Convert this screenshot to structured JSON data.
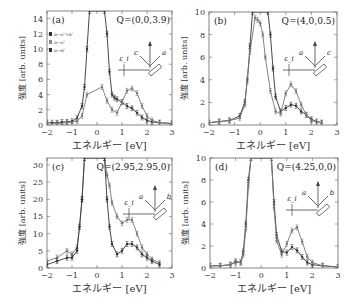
{
  "chart_data": [
    {
      "type": "line",
      "panel_label": "(a)",
      "title": "Q=(0,0,3.9)",
      "xlabel": "エネルギー [eV]",
      "ylabel": "強度 [arb. units]",
      "xlim": [
        -2,
        3
      ],
      "ylim": [
        0,
        15
      ],
      "xticks": [
        -2,
        -1,
        0,
        1,
        2,
        3
      ],
      "yticks": [
        0,
        2,
        4,
        6,
        8,
        10,
        12,
        14
      ],
      "legend": [
        "π→σ'+π'",
        "π→σ'",
        "π→π'"
      ],
      "legend_position": "top-left",
      "inset_labels": [
        "c",
        "a",
        "ε_i"
      ],
      "series": [
        {
          "name": "π→σ'+π'",
          "color": "#333333",
          "x": [
            -2,
            -1.8,
            -1.6,
            -1.4,
            -1.2,
            -1.0,
            -0.8,
            -0.6,
            -0.5,
            -0.4,
            -0.3,
            0.3,
            0.4,
            0.5,
            0.6,
            0.7,
            0.8,
            1.0,
            1.2,
            1.4,
            1.6,
            1.8,
            2.0,
            2.2,
            2.5,
            3.0
          ],
          "y": [
            0.3,
            0.3,
            0.3,
            0.4,
            0.4,
            0.5,
            0.9,
            2.5,
            5,
            10,
            15,
            15,
            12,
            7,
            4,
            3.6,
            3.4,
            3.0,
            2.5,
            2.2,
            1.6,
            1.0,
            0.6,
            0.4,
            0.3,
            0.2
          ]
        },
        {
          "name": "π→σ'",
          "color": "#777777",
          "x": [
            -2,
            -1.6,
            -1.2,
            -0.8,
            -0.6,
            -0.4,
            0.2,
            0.4,
            0.6,
            0.8,
            1.0,
            1.2,
            1.4,
            1.6,
            1.8,
            2.0,
            2.2,
            2.5,
            3.0
          ],
          "y": [
            0.3,
            0.2,
            0.3,
            0.5,
            1.2,
            4.0,
            5.0,
            3.2,
            2.0,
            1.6,
            3.0,
            4.5,
            4.8,
            4.2,
            2.5,
            1.2,
            0.6,
            0.3,
            0.2
          ]
        }
      ]
    },
    {
      "type": "line",
      "panel_label": "(b)",
      "title": "Q=(4,0,0.5)",
      "xlabel": "エネルギー [eV]",
      "ylabel": "強度 [arb. units]",
      "xlim": [
        -2,
        3
      ],
      "ylim": [
        0,
        10
      ],
      "xticks": [
        -2,
        -1,
        0,
        1,
        2,
        3
      ],
      "yticks": [
        0,
        2,
        4,
        6,
        8,
        10
      ],
      "inset_labels": [
        "a",
        "c",
        "ε_i"
      ],
      "series": [
        {
          "name": "π→σ'+π'",
          "color": "#333333",
          "x": [
            -2,
            -1.6,
            -1.2,
            -0.8,
            -0.6,
            -0.5,
            -0.4,
            -0.3,
            0.3,
            0.4,
            0.5,
            0.6,
            0.8,
            1.0,
            1.2,
            1.4,
            1.6,
            1.8,
            2.0,
            2.2,
            2.4
          ],
          "y": [
            0.2,
            0.3,
            0.4,
            0.8,
            2.0,
            4.0,
            7.0,
            10,
            10,
            8.0,
            5.0,
            2.5,
            1.2,
            1.5,
            1.8,
            1.7,
            1.2,
            0.9,
            0.5,
            0.3,
            0.2
          ]
        },
        {
          "name": "π→σ'",
          "color": "#777777",
          "x": [
            -2,
            -1.6,
            -1.2,
            -0.8,
            -0.6,
            -0.4,
            -0.2,
            -0.1,
            0.0,
            0.1,
            0.2,
            0.4,
            0.6,
            0.8,
            1.0,
            1.2,
            1.4,
            1.6,
            1.8,
            2.0,
            2.4
          ],
          "y": [
            0.2,
            0.3,
            0.4,
            0.6,
            1.8,
            6.5,
            9.5,
            9.3,
            9.0,
            8.0,
            6.0,
            3.0,
            1.2,
            1.0,
            2.8,
            3.6,
            3.0,
            1.8,
            0.9,
            0.4,
            0.2
          ]
        }
      ]
    },
    {
      "type": "line",
      "panel_label": "(c)",
      "title": "Q=(2.95,2.95,0)",
      "xlabel": "エネルギー [eV]",
      "ylabel": "強度 [arb. units]",
      "xlim": [
        -2,
        3
      ],
      "ylim": [
        0,
        32
      ],
      "xticks": [
        -2,
        -1,
        0,
        1,
        2,
        3
      ],
      "yticks": [
        0,
        5,
        10,
        15,
        20,
        25,
        30
      ],
      "inset_labels": [
        "a",
        "b",
        "ε_i"
      ],
      "series": [
        {
          "name": "π→σ'+π'",
          "color": "#777777",
          "x": [
            -2,
            -1.6,
            -1.2,
            -1.0,
            -0.8,
            -0.7,
            -0.6,
            -0.5,
            0.3,
            0.4,
            0.5,
            0.6,
            0.8,
            1.0,
            1.2,
            1.4,
            1.6,
            1.8,
            2.0,
            2.2,
            2.5
          ],
          "y": [
            2,
            3,
            5,
            4,
            6,
            12,
            20,
            32,
            32,
            27,
            24,
            19,
            15,
            13,
            14,
            14,
            10,
            6,
            4,
            2.5,
            1.5
          ]
        },
        {
          "name": "π→π'",
          "color": "#333333",
          "x": [
            -2,
            -1.6,
            -1.2,
            -1.0,
            -0.8,
            -0.7,
            -0.6,
            -0.5,
            0.3,
            0.4,
            0.5,
            0.6,
            0.8,
            1.0,
            1.2,
            1.4,
            1.6,
            1.8,
            2.0,
            2.2,
            2.5
          ],
          "y": [
            1,
            2,
            3,
            3,
            5,
            12,
            20,
            32,
            32,
            20,
            12,
            7,
            4,
            5,
            7,
            7,
            6,
            4,
            3,
            2,
            1
          ]
        }
      ]
    },
    {
      "type": "line",
      "panel_label": "(d)",
      "title": "Q=(4.25,0,0)",
      "xlabel": "エネルギー [eV]",
      "ylabel": "強度 [arb. units]",
      "xlim": [
        -2,
        3
      ],
      "ylim": [
        0,
        10
      ],
      "xticks": [
        -2,
        -1,
        0,
        1,
        2,
        3
      ],
      "yticks": [
        0,
        2,
        4,
        6,
        8,
        10
      ],
      "inset_labels": [
        "a",
        "b",
        "ε_i"
      ],
      "series": [
        {
          "name": "π→σ'+π'",
          "color": "#333333",
          "x": [
            -2,
            -1.6,
            -1.2,
            -1.0,
            -0.8,
            -0.7,
            -0.6,
            -0.5,
            -0.4,
            0.4,
            0.5,
            0.6,
            0.8,
            1.0,
            1.2,
            1.4,
            1.6,
            1.8,
            2.0,
            2.4,
            3.0
          ],
          "y": [
            0.2,
            0.2,
            0.3,
            0.6,
            0.5,
            1.5,
            4,
            8,
            10,
            10,
            6,
            3,
            1.5,
            1.4,
            1.9,
            1.6,
            1.0,
            0.5,
            0.3,
            0.2,
            0.1
          ]
        },
        {
          "name": "π→σ'",
          "color": "#777777",
          "x": [
            -2,
            -1.6,
            -1.2,
            -1.0,
            -0.8,
            -0.7,
            -0.6,
            -0.5,
            -0.4,
            0.4,
            0.5,
            0.6,
            0.8,
            1.0,
            1.2,
            1.4,
            1.6,
            1.8,
            2.0,
            2.4,
            3.0
          ],
          "y": [
            0.2,
            0.2,
            0.3,
            0.5,
            0.5,
            1.2,
            3.5,
            7.5,
            10,
            10,
            5.5,
            2.5,
            1.2,
            2.2,
            3.4,
            3.7,
            2.4,
            1.0,
            0.5,
            0.2,
            0.1
          ]
        }
      ]
    }
  ]
}
